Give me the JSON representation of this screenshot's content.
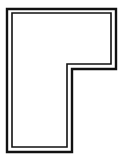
{
  "diagram": {
    "type": "floor-plan-outline",
    "shape": "L-shape",
    "caption_cut_off": "",
    "colors": {
      "stroke": "#111111",
      "background": "#ffffff"
    },
    "outer_outline": "7,9 116,9 116,69 72,69 72,152 7,152",
    "inner_outline": "12,13 111,13 111,64 67,64 67,147 12,147"
  }
}
